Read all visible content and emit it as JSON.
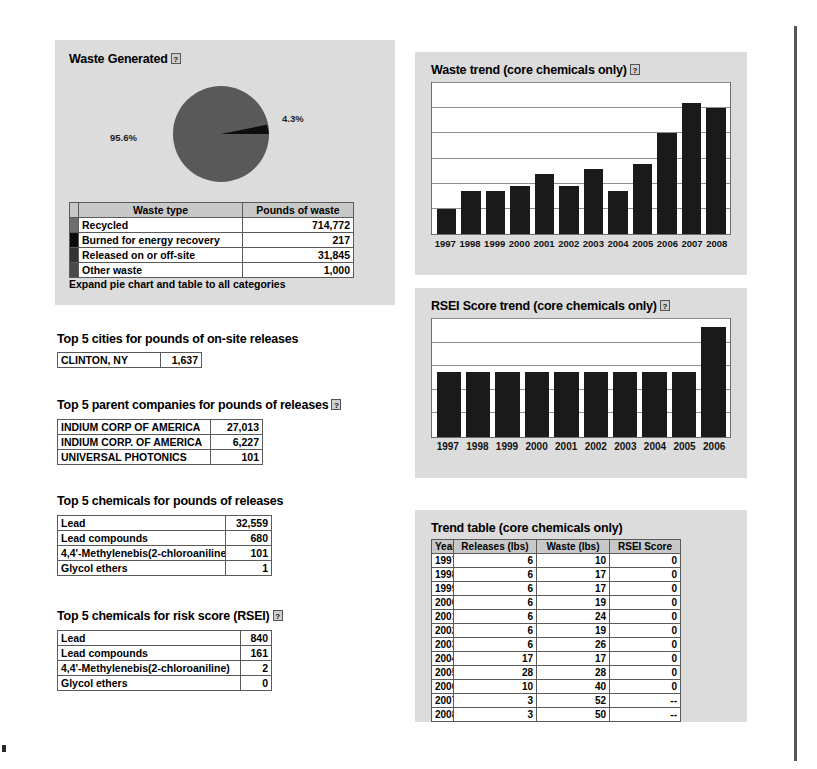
{
  "waste_generated": {
    "title": "Waste Generated",
    "help_glyph": "?",
    "pie": {
      "major_pct": "95.6%",
      "minor_pct": "4.3%",
      "major_value": 95.6,
      "minor_value": 4.3,
      "major_color": "#595959",
      "minor_color": "#0d0d0d"
    },
    "table": {
      "headers": [
        "Waste type",
        "Pounds of waste"
      ],
      "rows": [
        {
          "swatch": "#6e6e6e",
          "type": "Recycled",
          "pounds": "714,772"
        },
        {
          "swatch": "#0d0d0d",
          "type": "Burned for energy recovery",
          "pounds": "217"
        },
        {
          "swatch": "#333333",
          "type": "Released on or off-site",
          "pounds": "31,845"
        },
        {
          "swatch": "#4a4a4a",
          "type": "Other waste",
          "pounds": "1,000"
        }
      ]
    },
    "expand_link": "Expand pie chart and table to all categories"
  },
  "top_cities": {
    "heading": "Top 5 cities for pounds of on-site releases",
    "rows": [
      {
        "name": "CLINTON, NY",
        "value": "1,637"
      }
    ]
  },
  "top_companies": {
    "heading": "Top 5 parent companies for pounds of releases",
    "help_glyph": "?",
    "rows": [
      {
        "name": "INDIUM CORP OF AMERICA",
        "value": "27,013"
      },
      {
        "name": "INDIUM CORP. OF AMERICA",
        "value": "6,227"
      },
      {
        "name": "UNIVERSAL PHOTONICS",
        "value": "101"
      }
    ]
  },
  "top_chemicals_releases": {
    "heading": "Top 5 chemicals for pounds of releases",
    "rows": [
      {
        "name": "Lead",
        "value": "32,559"
      },
      {
        "name": "Lead compounds",
        "value": "680"
      },
      {
        "name": "4,4'-Methylenebis(2-chloroaniline)",
        "value": "101"
      },
      {
        "name": "Glycol ethers",
        "value": "1"
      }
    ]
  },
  "top_chemicals_risk": {
    "heading": "Top 5 chemicals for risk score (RSEI)",
    "help_glyph": "?",
    "rows": [
      {
        "name": "Lead",
        "value": "840"
      },
      {
        "name": "Lead compounds",
        "value": "161"
      },
      {
        "name": "4,4'-Methylenebis(2-chloroaniline)",
        "value": "2"
      },
      {
        "name": "Glycol ethers",
        "value": "0"
      }
    ]
  },
  "waste_trend": {
    "title": "Waste trend (core chemicals only)",
    "help_glyph": "?"
  },
  "rsei_trend": {
    "title": "RSEI Score trend (core chemicals only)",
    "help_glyph": "?"
  },
  "trend_table": {
    "title": "Trend table (core chemicals only)",
    "headers": [
      "Year",
      "Releases (lbs)",
      "Waste (lbs)",
      "RSEI Score"
    ],
    "rows": [
      [
        "1997",
        "6",
        "10",
        "0"
      ],
      [
        "1998",
        "6",
        "17",
        "0"
      ],
      [
        "1999",
        "6",
        "17",
        "0"
      ],
      [
        "2000",
        "6",
        "19",
        "0"
      ],
      [
        "2001",
        "6",
        "24",
        "0"
      ],
      [
        "2002",
        "6",
        "19",
        "0"
      ],
      [
        "2003",
        "6",
        "26",
        "0"
      ],
      [
        "2004",
        "17",
        "17",
        "0"
      ],
      [
        "2005",
        "28",
        "28",
        "0"
      ],
      [
        "2006",
        "10",
        "40",
        "0"
      ],
      [
        "2007",
        "3",
        "52",
        "--"
      ],
      [
        "2008",
        "3",
        "50",
        "--"
      ]
    ]
  },
  "chart_data": [
    {
      "type": "bar",
      "title": "Waste trend (core chemicals only)",
      "categories": [
        "1997",
        "1998",
        "1999",
        "2000",
        "2001",
        "2002",
        "2003",
        "2004",
        "2005",
        "2006",
        "2007",
        "2008"
      ],
      "values": [
        10,
        17,
        17,
        19,
        24,
        19,
        26,
        17,
        28,
        40,
        52,
        50
      ],
      "xlabel": "",
      "ylabel": "Waste (lbs)",
      "ylim": [
        0,
        60
      ],
      "gridlines": [
        10,
        20,
        30,
        40,
        50,
        60
      ],
      "grid": true,
      "legend": "none",
      "bar_color": "#1a1a1a",
      "plot_background": "#ffffff"
    },
    {
      "type": "bar",
      "title": "RSEI Score trend (core chemicals only)",
      "categories": [
        "1997",
        "1998",
        "1999",
        "2000",
        "2001",
        "2002",
        "2003",
        "2004",
        "2005",
        "2006"
      ],
      "values": [
        0.55,
        0.55,
        0.55,
        0.55,
        0.55,
        0.55,
        0.55,
        0.55,
        0.55,
        0.93
      ],
      "xlabel": "",
      "ylabel": "RSEI Score",
      "ylim": [
        0,
        1
      ],
      "gridlines": [
        0.2,
        0.4,
        0.6,
        0.8,
        1.0
      ],
      "grid": true,
      "legend": "none",
      "bar_color": "#1a1a1a",
      "plot_background": "#ffffff"
    },
    {
      "type": "pie",
      "title": "Waste Generated",
      "labels": [
        "Recycled",
        "Released on or off-site",
        "Other waste",
        "Burned for energy recovery"
      ],
      "display_labels": [
        "95.6%",
        "4.3%"
      ],
      "values": [
        714772,
        31845,
        1000,
        217
      ],
      "percentages": [
        95.6,
        4.3,
        0.13,
        0.03
      ],
      "colors": [
        "#595959",
        "#0d0d0d",
        "#4a4a4a",
        "#333333"
      ],
      "legend": "table-below"
    },
    {
      "type": "table",
      "title": "Trend table (core chemicals only)",
      "columns": [
        "Year",
        "Releases (lbs)",
        "Waste (lbs)",
        "RSEI Score"
      ],
      "rows": [
        [
          "1997",
          6,
          10,
          0
        ],
        [
          "1998",
          6,
          17,
          0
        ],
        [
          "1999",
          6,
          17,
          0
        ],
        [
          "2000",
          6,
          19,
          0
        ],
        [
          "2001",
          6,
          24,
          0
        ],
        [
          "2002",
          6,
          19,
          0
        ],
        [
          "2003",
          6,
          26,
          0
        ],
        [
          "2004",
          17,
          17,
          0
        ],
        [
          "2005",
          28,
          28,
          0
        ],
        [
          "2006",
          10,
          40,
          0
        ],
        [
          "2007",
          3,
          52,
          "--"
        ],
        [
          "2008",
          3,
          50,
          "--"
        ]
      ]
    }
  ]
}
